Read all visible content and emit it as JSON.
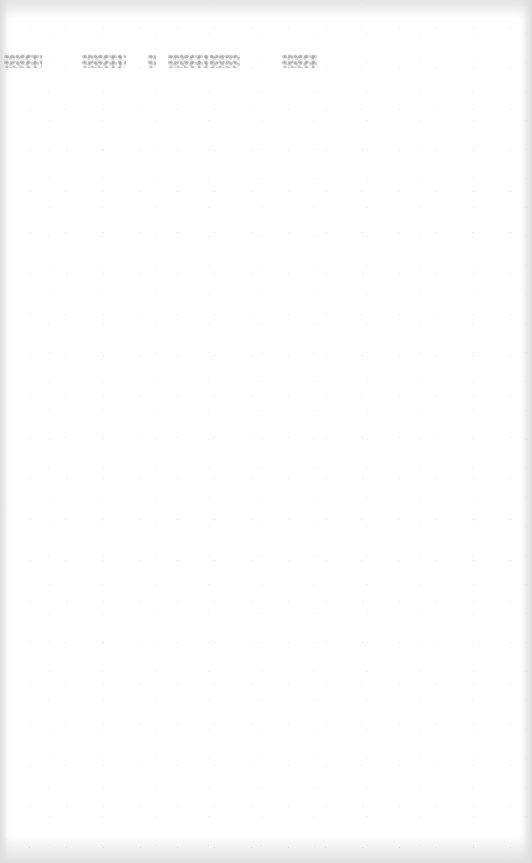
{
  "document": {
    "type": "scanned-page",
    "content_state": "blank page with faint illegible bleed-through text",
    "bleed_through": {
      "legible": false,
      "text": "",
      "position": "top",
      "fragments": 5
    }
  },
  "colors": {
    "paper": "#ffffff",
    "edge_shadow": "#e0e0e0",
    "bleed_ink": "#969696"
  }
}
